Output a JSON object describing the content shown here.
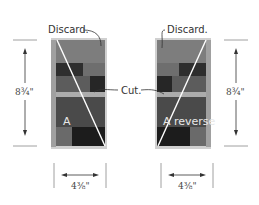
{
  "labels": {
    "discard_left": "Discard.",
    "discard_right": "Discard.",
    "cut": "Cut.",
    "block_left": "A",
    "block_right": "A reverse"
  },
  "dimensions": {
    "height_left": "8¾\"",
    "height_right": "8¾\"",
    "width_left": "4⅜\"",
    "width_right": "4⅜\""
  },
  "colors": {
    "frame": "#c8c8c8",
    "discard": "#7d7d7d",
    "dark": "#2e2e2e",
    "medium": "#6e6e6e",
    "darkmedium": "#4a4a4a",
    "light_strip": "#acacac",
    "black": "#1c1c1c",
    "cut_line": "#ffffff",
    "rule": "#888888"
  }
}
